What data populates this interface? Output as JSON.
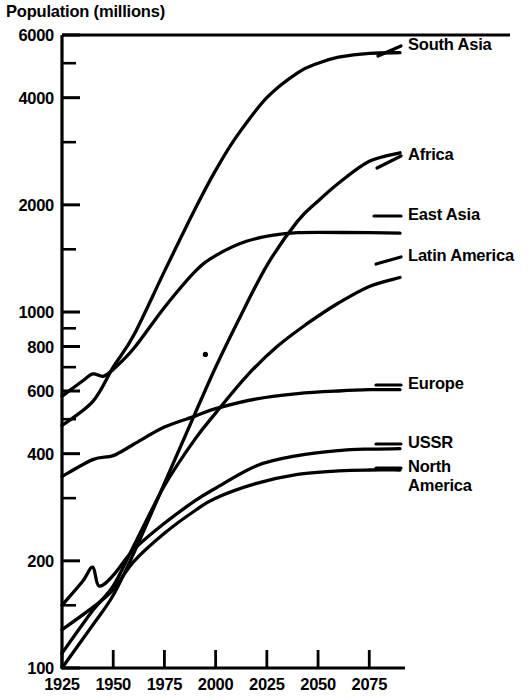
{
  "chart_data": {
    "type": "line",
    "title": "Population (millions)",
    "xlabel": "",
    "ylabel": "Population (millions)",
    "yscale": "log",
    "ylim": [
      100,
      6000
    ],
    "xlim": [
      1925,
      2090
    ],
    "grid": false,
    "legend_position": "right-inline",
    "x_ticks": [
      "1925",
      "1950",
      "1975",
      "2000",
      "2025",
      "2050",
      "2075"
    ],
    "x_tick_values": [
      1925,
      1950,
      1975,
      2000,
      2025,
      2050,
      2075
    ],
    "y_ticks": [
      "6000",
      "4000",
      "2000",
      "1000",
      "800",
      "600",
      "400",
      "200",
      "100"
    ],
    "y_tick_values": [
      6000,
      4000,
      2000,
      1000,
      800,
      600,
      400,
      200,
      100
    ],
    "y_minor_ticks": [
      5000,
      3000,
      1500,
      900,
      700,
      500,
      300,
      150
    ],
    "series": [
      {
        "name": "South Asia",
        "color": "#000000",
        "x": [
          1925,
          1940,
          1950,
          1960,
          1975,
          1990,
          2000,
          2010,
          2025,
          2040,
          2050,
          2060,
          2075,
          2090
        ],
        "values": [
          480,
          560,
          700,
          860,
          1300,
          1950,
          2500,
          3100,
          4000,
          4700,
          5000,
          5200,
          5330,
          5350
        ]
      },
      {
        "name": "Africa",
        "color": "#000000",
        "x": [
          1925,
          1940,
          1950,
          1960,
          1975,
          1990,
          2000,
          2010,
          2025,
          2040,
          2050,
          2060,
          2075,
          2090
        ],
        "values": [
          100,
          132,
          160,
          210,
          330,
          520,
          700,
          920,
          1350,
          1800,
          2050,
          2300,
          2650,
          2800
        ]
      },
      {
        "name": "East Asia",
        "color": "#000000",
        "x": [
          1925,
          1935,
          1940,
          1945,
          1950,
          1960,
          1975,
          1990,
          2000,
          2015,
          2030,
          2040,
          2050,
          2075,
          2090
        ],
        "values": [
          580,
          640,
          670,
          660,
          690,
          790,
          1030,
          1300,
          1440,
          1580,
          1650,
          1670,
          1675,
          1670,
          1665
        ]
      },
      {
        "name": "Latin America",
        "color": "#000000",
        "x": [
          1925,
          1940,
          1950,
          1960,
          1975,
          1990,
          2000,
          2015,
          2030,
          2045,
          2060,
          2075,
          2090
        ],
        "values": [
          110,
          145,
          170,
          220,
          325,
          440,
          520,
          660,
          800,
          930,
          1060,
          1180,
          1250
        ]
      },
      {
        "name": "Europe",
        "color": "#000000",
        "x": [
          1925,
          1940,
          1950,
          1960,
          1975,
          1990,
          2000,
          2020,
          2040,
          2060,
          2075,
          2090
        ],
        "values": [
          345,
          385,
          395,
          425,
          475,
          510,
          535,
          570,
          590,
          600,
          605,
          605
        ]
      },
      {
        "name": "USSR",
        "color": "#000000",
        "x": [
          1925,
          1935,
          1940,
          1943,
          1950,
          1960,
          1975,
          1990,
          2000,
          2020,
          2040,
          2060,
          2075,
          2090
        ],
        "values": [
          150,
          175,
          192,
          170,
          182,
          215,
          255,
          295,
          320,
          370,
          395,
          408,
          412,
          413
        ]
      },
      {
        "name": "North America",
        "color": "#000000",
        "x": [
          1925,
          1940,
          1950,
          1960,
          1975,
          1990,
          2000,
          2020,
          2040,
          2060,
          2075,
          2090
        ],
        "values": [
          128,
          148,
          166,
          199,
          239,
          277,
          300,
          330,
          350,
          358,
          360,
          360
        ]
      }
    ],
    "annotations": [
      {
        "name": "stray-dot",
        "x": 1995,
        "y": 760
      }
    ]
  },
  "axis_title": "Population (millions)",
  "series_labels": [
    {
      "name": "South Asia",
      "text": "South Asia",
      "x": 408,
      "y": 45
    },
    {
      "name": "Africa",
      "text": "Africa",
      "x": 408,
      "y": 155
    },
    {
      "name": "East Asia",
      "text": "East Asia",
      "x": 408,
      "y": 215
    },
    {
      "name": "Latin America",
      "text": "Latin America",
      "x": 408,
      "y": 256
    },
    {
      "name": "Europe",
      "text": "Europe",
      "x": 408,
      "y": 384
    },
    {
      "name": "USSR",
      "text": "USSR",
      "x": 408,
      "y": 443
    },
    {
      "name": "North America",
      "text": "North\nAmerica",
      "x": 408,
      "y": 467
    }
  ]
}
